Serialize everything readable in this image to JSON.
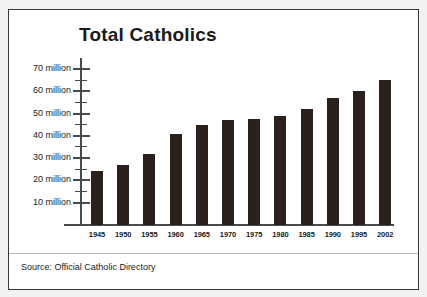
{
  "chart_data": {
    "type": "bar",
    "title": "Total Catholics",
    "xlabel": "",
    "ylabel": "",
    "categories": [
      "1945",
      "1950",
      "1955",
      "1960",
      "1965",
      "1970",
      "1975",
      "1980",
      "1985",
      "1990",
      "1995",
      "2002"
    ],
    "values": [
      24,
      27,
      32,
      41,
      45,
      47,
      47.5,
      49,
      52,
      57,
      60,
      65
    ],
    "value_unit": "million",
    "ylim": [
      0,
      72
    ],
    "y_ticks": [
      10,
      20,
      30,
      40,
      50,
      60,
      70
    ],
    "y_tick_labels": [
      "10 million",
      "20 million",
      "30 million",
      "40 million",
      "50 million",
      "60 million",
      "70 million"
    ],
    "y_minor_ticks": [
      15,
      25,
      35,
      45,
      55,
      65
    ],
    "grid": false,
    "legend": null,
    "bar_color": "#2b201c",
    "axis_color": "#4a4a4a",
    "source": "Source: Official Catholic Directory"
  },
  "figure": {
    "border_color": "#3a3a3a",
    "background": "#ffffff",
    "outer_background": "#f2f2f2"
  }
}
